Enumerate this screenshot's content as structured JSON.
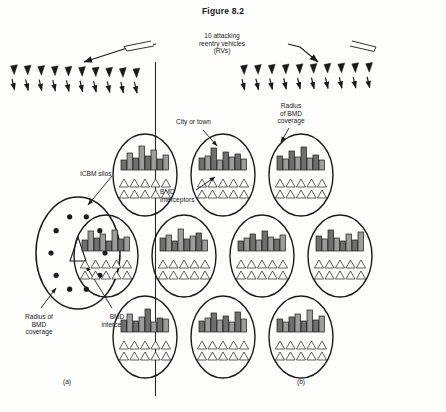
{
  "figure": {
    "title": "Figure 8.2",
    "rv_label": "10 attacking\nreentry vehicles\n(RVs)"
  },
  "panel_a": {
    "label": "(a)",
    "silos_label": "ICBM silos",
    "radius_label": "Radius of\nBMD\ncoverage",
    "interceptor_label": "BMD\ninterceptor",
    "silo_count": 10,
    "interceptor_count": 1
  },
  "panel_b": {
    "label": "(b)",
    "city_label": "City or town",
    "radius_label": "Radius\nof BMD\ncoverage",
    "interceptors_label": "BMD\ninterceptors",
    "city_count": 10,
    "rows": [
      3,
      4,
      3
    ],
    "interceptors_per_city": 10
  },
  "attack": {
    "left_rv_count": 10,
    "right_rv_count": 10
  },
  "colors": {
    "ink": "#1a1a1a",
    "building_fill": "#9c9c9c",
    "building_fill_dark": "#6f6f6f",
    "paper": "#fdfdfb"
  },
  "chart_data": {
    "type": "diagram",
    "title": "Figure 8.2",
    "series": [
      {
        "name": "attacking RVs (left, panel a)",
        "values": [
          10
        ]
      },
      {
        "name": "attacking RVs (right, panel b)",
        "values": [
          10
        ]
      },
      {
        "name": "ICBM silos in panel a",
        "values": [
          10
        ]
      },
      {
        "name": "BMD interceptors in panel a",
        "values": [
          1
        ]
      },
      {
        "name": "cities in panel b",
        "values": [
          10
        ]
      },
      {
        "name": "BMD interceptors per city",
        "values": [
          10
        ]
      }
    ]
  }
}
